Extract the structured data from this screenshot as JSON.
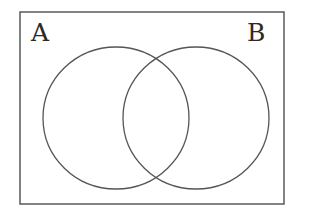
{
  "diagram": {
    "type": "venn",
    "universe": {
      "x": 20,
      "y": 12,
      "width": 264,
      "height": 192
    },
    "sets": [
      {
        "label": "A",
        "cx": 116,
        "cy": 118,
        "rx": 73,
        "ry": 71
      },
      {
        "label": "B",
        "cx": 196,
        "cy": 118,
        "rx": 73,
        "ry": 71
      }
    ],
    "stroke_color": "#555555"
  }
}
